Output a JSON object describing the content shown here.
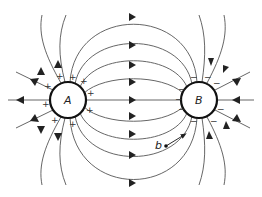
{
  "diagram": {
    "type": "electric-field-lines",
    "charges": [
      {
        "id": "A",
        "label": "A",
        "sign": "+",
        "cx": 68,
        "cy": 100,
        "r": 18
      },
      {
        "id": "B",
        "label": "B",
        "sign": "−",
        "cx": 199,
        "cy": 100,
        "r": 18
      }
    ],
    "point": {
      "label": "b",
      "x": 166,
      "y": 146
    },
    "signs": {
      "positive": "+",
      "negative": "−"
    },
    "colors": {
      "line": "#555555",
      "arrow": "#222222",
      "circle": "#111111"
    }
  }
}
